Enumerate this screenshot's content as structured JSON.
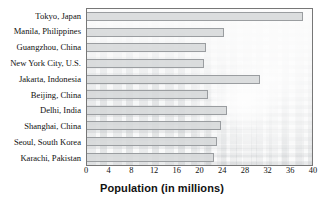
{
  "chart_data": {
    "type": "bar",
    "orientation": "horizontal",
    "title": "",
    "xlabel": "Population (in millions)",
    "ylabel": "",
    "xlim": [
      0,
      40
    ],
    "xticks": [
      0,
      4,
      8,
      12,
      16,
      20,
      24,
      28,
      32,
      36,
      40
    ],
    "grid": false,
    "legend": null,
    "categories": [
      "Tokyo, Japan",
      "Manila, Philippines",
      "Guangzhou, China",
      "New York City, U.S.",
      "Jakarta, Indonesia",
      "Beijing, China",
      "Delhi, India",
      "Shanghai, China",
      "Seoul, South Korea",
      "Karachi, Pakistan"
    ],
    "values": [
      38.4,
      24.3,
      21.1,
      20.8,
      30.8,
      21.5,
      24.8,
      23.8,
      23.1,
      22.6
    ],
    "bar_color": "#d6d8da",
    "bar_border_color": "#9a9da0",
    "background": "faded-city-skyline-photo"
  },
  "axis": {
    "x_title": "Population (in millions)",
    "tick_labels": [
      "0",
      "4",
      "8",
      "12",
      "16",
      "20",
      "24",
      "28",
      "32",
      "36",
      "40"
    ]
  },
  "rows": [
    {
      "label": "Tokyo, Japan",
      "value": 38.4
    },
    {
      "label": "Manila, Philippines",
      "value": 24.3
    },
    {
      "label": "Guangzhou, China",
      "value": 21.1
    },
    {
      "label": "New York City, U.S.",
      "value": 20.8
    },
    {
      "label": "Jakarta, Indonesia",
      "value": 30.8
    },
    {
      "label": "Beijing, China",
      "value": 21.5
    },
    {
      "label": "Delhi, India",
      "value": 24.8
    },
    {
      "label": "Shanghai, China",
      "value": 23.8
    },
    {
      "label": "Seoul, South Korea",
      "value": 23.1
    },
    {
      "label": "Karachi, Pakistan",
      "value": 22.6
    }
  ]
}
